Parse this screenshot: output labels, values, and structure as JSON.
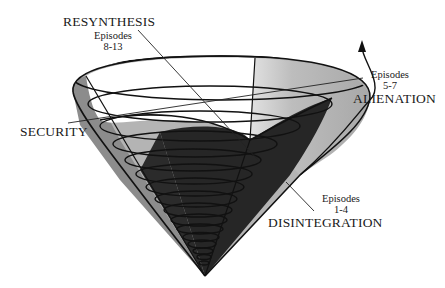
{
  "diagram": {
    "type": "spiral cone diagram",
    "colors": {
      "background": "#ffffff",
      "outline": "#111111",
      "light_band": "#bdbdbd",
      "mid_band": "#8a8a8a",
      "dark_band": "#262626",
      "rim_highlight": "#d6d6d6"
    },
    "labels": {
      "resynthesis": {
        "title": "RESYNTHESIS",
        "episodes_label": "Episodes",
        "episodes_range": "8-13"
      },
      "alienation": {
        "title": "ALIENATION",
        "episodes_label": "Episodes",
        "episodes_range": "5-7"
      },
      "security": {
        "title": "SECURITY"
      },
      "disintegration": {
        "title": "DISINTEGRATION",
        "episodes_label": "Episodes",
        "episodes_range": "1-4"
      }
    },
    "icons": {
      "arrow": "upward-arrow-icon"
    }
  }
}
